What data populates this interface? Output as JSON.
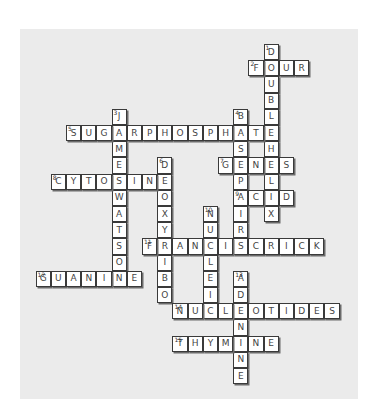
{
  "puzzle": {
    "type": "crossword",
    "grid": {
      "origin_x": 66,
      "origin_y": 44,
      "cell_w": 15.2,
      "cell_h": 16.2
    },
    "words": [
      {
        "num": "1",
        "dir": "down",
        "row": 0,
        "col": 13,
        "answer": "DOUBLEHELIX"
      },
      {
        "num": "2",
        "dir": "across",
        "row": 1,
        "col": 12,
        "answer": "FOUR"
      },
      {
        "num": "3",
        "dir": "down",
        "row": 4,
        "col": 3,
        "answer": "JAMESWATSON"
      },
      {
        "num": "4",
        "dir": "down",
        "row": 4,
        "col": 11,
        "answer": "BASEPAIRS"
      },
      {
        "num": "5",
        "dir": "across",
        "row": 5,
        "col": 0,
        "answer": "SUGARPHOSPHATE"
      },
      {
        "num": "6",
        "dir": "down",
        "row": 7,
        "col": 6,
        "answer": "DEOXYRIBO"
      },
      {
        "num": "7",
        "dir": "across",
        "row": 7,
        "col": 10,
        "answer": "GENES"
      },
      {
        "num": "8",
        "dir": "across",
        "row": 8,
        "col": -1,
        "answer": "CYTOSINE"
      },
      {
        "num": "9",
        "dir": "across",
        "row": 9,
        "col": 11,
        "answer": "ACID"
      },
      {
        "num": "10",
        "dir": "down",
        "row": 10,
        "col": 9,
        "answer": "NUCLEIC"
      },
      {
        "num": "11",
        "dir": "across",
        "row": 12,
        "col": 5,
        "answer": "FRANCISCRICK"
      },
      {
        "num": "12",
        "dir": "across",
        "row": 14,
        "col": -2,
        "answer": "GUANINE"
      },
      {
        "num": "13",
        "dir": "down",
        "row": 14,
        "col": 11,
        "answer": "ADENINE"
      },
      {
        "num": "14",
        "dir": "across",
        "row": 16,
        "col": 7,
        "answer": "NUCLEOTIDES"
      },
      {
        "num": "15",
        "dir": "across",
        "row": 18,
        "col": 7,
        "answer": "THYMINE"
      }
    ]
  },
  "colors": {
    "panel": "#ebebeb",
    "cell_fill": "#ffffff",
    "cell_border": "#3a3a3a",
    "letter": "#444444"
  }
}
